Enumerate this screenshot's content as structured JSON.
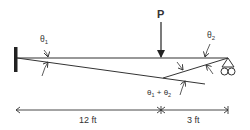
{
  "diagram": {
    "type": "beam-deflection",
    "load": {
      "label": "P"
    },
    "angles": {
      "theta1": {
        "symbol": "θ",
        "subscript": "1"
      },
      "theta2": {
        "symbol": "θ",
        "subscript": "2"
      },
      "sum": {
        "text1": "θ",
        "sub1": "1",
        "plus": " + ",
        "text2": "θ",
        "sub2": "2"
      }
    },
    "dimensions": {
      "left": "12 ft",
      "right": "3 ft"
    },
    "supports": {
      "left": "fixed-wall",
      "right": "roller"
    },
    "colors": {
      "line": "#333333",
      "wall": "#222222"
    }
  }
}
